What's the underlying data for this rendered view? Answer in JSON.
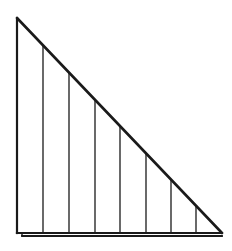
{
  "diagram": {
    "type": "right-triangle-with-vertical-strips",
    "stroke_color": "#1a1a1a",
    "background": "#ffffff",
    "triangle": {
      "apex": [
        17,
        18
      ],
      "bottom_left": [
        17,
        233
      ],
      "bottom_right": [
        222,
        233
      ]
    },
    "vertical_lines_x": [
      43,
      69,
      95,
      120,
      146,
      171,
      196
    ],
    "base_offset_line": {
      "x1": 22,
      "x2": 222,
      "y": 236
    },
    "strip_count": 8
  }
}
